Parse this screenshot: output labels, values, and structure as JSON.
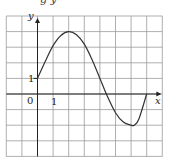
{
  "header_fragment": "g   y",
  "chart_data": {
    "type": "line",
    "title": "",
    "xlabel": "x",
    "ylabel": "y",
    "tick_labels": {
      "origin": "0",
      "x": [
        "1"
      ],
      "y": [
        "1"
      ]
    },
    "xlim": [
      -2,
      8
    ],
    "ylim": [
      -4,
      5
    ],
    "grid": true,
    "grid_step": 1,
    "series": [
      {
        "name": "f(x)",
        "x": [
          0,
          0.5,
          1,
          1.5,
          2,
          2.5,
          3,
          3.5,
          4,
          4.5,
          5,
          5.5,
          6,
          6.2,
          6.5,
          7
        ],
        "y": [
          1,
          2.1,
          3.1,
          3.75,
          4,
          3.8,
          3.2,
          2.2,
          1.0,
          -0.2,
          -1.2,
          -1.8,
          -2.0,
          -2.0,
          -1.6,
          0
        ]
      }
    ],
    "key_points": {
      "y_intercept": [
        0,
        1
      ],
      "maximum": [
        2,
        4
      ],
      "x_intercept": [
        4.4,
        0
      ],
      "minimum": [
        6.1,
        -2
      ],
      "end": [
        7,
        0
      ]
    }
  },
  "colors": {
    "grid": "#9a9a9a",
    "axis": "#222222",
    "curve": "#333333"
  }
}
